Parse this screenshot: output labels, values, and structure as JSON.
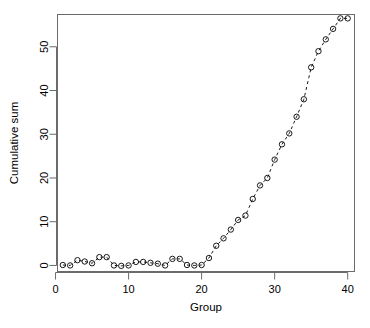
{
  "chart_data": {
    "type": "scatter",
    "title": "",
    "subtitle": "",
    "xlabel": "Group",
    "ylabel": "Cumulative sum",
    "xlim": [
      0.2,
      41.0
    ],
    "ylim": [
      -1.5,
      57.5
    ],
    "xticks": [
      0,
      10,
      20,
      30,
      40
    ],
    "xticklabels": [
      "0",
      "10",
      "20",
      "30",
      "40"
    ],
    "yticks": [
      0,
      10,
      20,
      30,
      40,
      50
    ],
    "yticklabels": [
      "0",
      "10",
      "20",
      "30",
      "40",
      "50"
    ],
    "grid": false,
    "legend": null,
    "legend_position": "none",
    "marker": "open-circle",
    "marker_color": "#000000",
    "line_style": "dashed",
    "line_color": "#000000",
    "box": true,
    "x": [
      1,
      2,
      3,
      4,
      5,
      6,
      7,
      8,
      9,
      10,
      11,
      12,
      13,
      14,
      15,
      16,
      17,
      18,
      19,
      20,
      21,
      22,
      23,
      24,
      25,
      26,
      27,
      28,
      29,
      30,
      31,
      32,
      33,
      34,
      35,
      36,
      37,
      38,
      39,
      40
    ],
    "y": [
      0.1,
      0.0,
      1.2,
      0.9,
      0.5,
      1.9,
      1.9,
      0.0,
      -0.1,
      0.0,
      0.8,
      0.8,
      0.6,
      0.4,
      0.0,
      1.5,
      1.5,
      0.1,
      0.0,
      0.1,
      1.7,
      4.5,
      6.2,
      8.2,
      10.4,
      11.4,
      15.2,
      18.3,
      20.0,
      24.2,
      27.7,
      30.2,
      34.0,
      38.0,
      45.3,
      49.0,
      51.7,
      54.1,
      56.5,
      56.5
    ],
    "xvalues_note": "",
    "axis_color": "#6b6b6b"
  },
  "figure": {
    "background_color": "#ffffff",
    "plot_box": {
      "left": 57,
      "top": 14,
      "right": 355,
      "bottom": 272
    }
  }
}
